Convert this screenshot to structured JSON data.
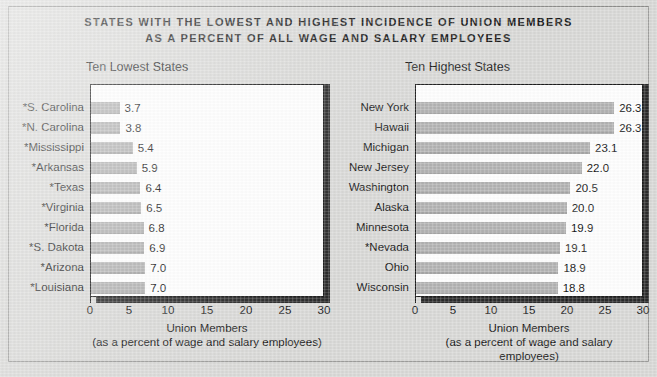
{
  "title": {
    "line1": "STATES WITH THE LOWEST AND HIGHEST INCIDENCE OF UNION MEMBERS",
    "line2": "AS A PERCENT OF ALL WAGE AND SALARY EMPLOYEES"
  },
  "axis_caption": {
    "line1": "Union Members",
    "line2": "(as a percent of wage and salary employees)"
  },
  "colors": {
    "background": "#d9d9d7",
    "plot_background": "#ffffff",
    "bar_fill": "#b3b3b3",
    "plot_border": "#1d1d1d",
    "shadow": "#2b2b2b",
    "text": "#141414"
  },
  "chart_data": [
    {
      "type": "bar",
      "orientation": "horizontal",
      "title": "Ten Lowest States",
      "categories": [
        "*S. Carolina",
        "*N. Carolina",
        "*Mississippi",
        "*Arkansas",
        "*Texas",
        "*Virginia",
        "*Florida",
        "*S. Dakota",
        "*Arizona",
        "*Louisiana"
      ],
      "values": [
        3.7,
        3.8,
        5.4,
        5.9,
        6.4,
        6.5,
        6.8,
        6.9,
        7.0,
        7.0
      ],
      "value_labels": [
        "3.7",
        "3.8",
        "5.4",
        "5.9",
        "6.4",
        "6.5",
        "6.8",
        "6.9",
        "7.0",
        "7.0"
      ],
      "xlabel": "Union Members",
      "xlabel_sub": "(as a percent of wage and salary employees)",
      "ylabel": "",
      "xlim": [
        0,
        30
      ],
      "xticks": [
        0,
        5,
        10,
        15,
        20,
        25,
        30
      ],
      "xtick_labels": [
        "0",
        "5",
        "10",
        "15",
        "20",
        "25",
        "30"
      ],
      "grid": false,
      "legend": false
    },
    {
      "type": "bar",
      "orientation": "horizontal",
      "title": "Ten Highest States",
      "categories": [
        "New York",
        "Hawaii",
        "Michigan",
        "New Jersey",
        "Washington",
        "Alaska",
        "Minnesota",
        "*Nevada",
        "Ohio",
        "Wisconsin"
      ],
      "values": [
        26.3,
        26.3,
        23.1,
        22.0,
        20.5,
        20.0,
        19.9,
        19.1,
        18.9,
        18.8
      ],
      "value_labels": [
        "26.3",
        "26.3",
        "23.1",
        "22.0",
        "20.5",
        "20.0",
        "19.9",
        "19.1",
        "18.9",
        "18.8"
      ],
      "xlabel": "Union Members",
      "xlabel_sub": "(as a percent of wage and salary employees)",
      "ylabel": "",
      "xlim": [
        0,
        30
      ],
      "xticks": [
        0,
        5,
        10,
        15,
        20,
        25,
        30
      ],
      "xtick_labels": [
        "0",
        "5",
        "10",
        "15",
        "20",
        "25",
        "30"
      ],
      "grid": false,
      "legend": false
    }
  ]
}
